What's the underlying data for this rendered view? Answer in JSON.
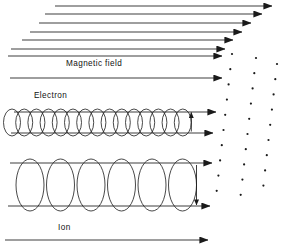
{
  "figure": {
    "background_color": "#ffffff",
    "line_color": "#1a1a1a",
    "labels": {
      "magnetic_field": "Magnetic field",
      "electron": "Electron",
      "ion": "Ion"
    }
  },
  "chart_data": {
    "type": "diagram",
    "arrow_direction": "right",
    "perspective_field_lines": [
      {
        "id": "field-line-1",
        "x1": 55,
        "y1": 6,
        "x2": 272,
        "y2": 6
      },
      {
        "id": "field-line-2",
        "x1": 45,
        "y1": 14,
        "x2": 262,
        "y2": 14
      },
      {
        "id": "field-line-3",
        "x1": 39,
        "y1": 23,
        "x2": 251,
        "y2": 23
      },
      {
        "id": "field-line-4",
        "x1": 30,
        "y1": 32,
        "x2": 242,
        "y2": 32
      },
      {
        "id": "field-line-5",
        "x1": 22,
        "y1": 40,
        "x2": 233,
        "y2": 40
      },
      {
        "id": "field-line-6",
        "x1": 11,
        "y1": 49,
        "x2": 225,
        "y2": 49
      },
      {
        "id": "field-line-7",
        "x1": 8,
        "y1": 56,
        "x2": 222,
        "y2": 56
      }
    ],
    "straight_field_lines": [
      {
        "id": "field-line-mid",
        "x1": 10,
        "y1": 78,
        "x2": 222,
        "y2": 78
      },
      {
        "id": "electron-axis-top",
        "x1": 14,
        "y1": 112,
        "x2": 216,
        "y2": 112
      },
      {
        "id": "electron-axis-bottom",
        "x1": 11,
        "y1": 133,
        "x2": 213,
        "y2": 133
      },
      {
        "id": "ion-axis-top",
        "x1": 10,
        "y1": 163,
        "x2": 212,
        "y2": 163
      },
      {
        "id": "ion-axis-bottom",
        "x1": 8,
        "y1": 206,
        "x2": 210,
        "y2": 206
      },
      {
        "id": "field-line-bottom",
        "x1": 5,
        "y1": 240,
        "x2": 208,
        "y2": 240
      }
    ],
    "electron_helix": {
      "label": "Electron",
      "coil_count": 15,
      "x_start": 12,
      "x_step": 12.2,
      "ellipse_rx": 8.5,
      "ellipse_ry": 13.5,
      "center_y": 122.5,
      "rotation_arrow": "up",
      "pitch": "tight"
    },
    "ion_helix": {
      "label": "Ion",
      "coil_count": 6,
      "x_start": 30,
      "x_step": 30.5,
      "ellipse_rx": 14,
      "ellipse_ry": 26,
      "center_y": 185,
      "rotation_arrow": "down",
      "pitch": "wide"
    },
    "dot_columns": [
      {
        "id": "dot-column-near",
        "dot_count": 10,
        "x_top": 232,
        "y_top": 54,
        "dx": -1.7,
        "dy": 15.2
      },
      {
        "id": "dot-column-middle",
        "dot_count": 10,
        "x_top": 256,
        "y_top": 58,
        "dx": -1.7,
        "dy": 15.2
      },
      {
        "id": "dot-column-far",
        "dot_count": 9,
        "x_top": 277,
        "y_top": 64,
        "dx": -1.7,
        "dy": 15.2
      }
    ],
    "label_positions": {
      "magnetic_field": {
        "x": 66,
        "y": 66
      },
      "electron": {
        "x": 34,
        "y": 98
      },
      "ion": {
        "x": 58,
        "y": 230
      }
    }
  }
}
